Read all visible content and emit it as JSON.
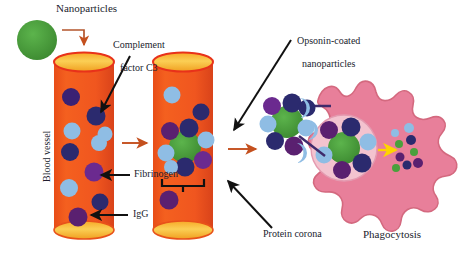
{
  "figure": {
    "type": "biomedical-schematic",
    "title_visible": false,
    "background": "#ffffff"
  },
  "labels": {
    "nanoparticles": "Nanoparticles",
    "complement_line1": "Complement",
    "complement_line2": "factor C3",
    "blood_vessel": "Blood vessel",
    "fibrinogen": "Fibrinogen",
    "igg": "IgG",
    "opsonin_line1": "Opsonin-coated",
    "opsonin_line2": "nanoparticles",
    "protein_corona": "Protein corona",
    "phagocytosis": "Phagocytosis"
  },
  "colors": {
    "nanoparticle_green": "#4aa03c",
    "nanoparticle_green_dark": "#3d8a31",
    "vessel_orange": "#f0561f",
    "vessel_edge": "#d9431a",
    "vessel_lumen_yellow": "#f9c23c",
    "vessel_lumen_edge": "#e8321a",
    "protein_navy": "#2b2a6e",
    "protein_purple": "#5a2070",
    "protein_violet": "#6b2a8f",
    "protein_lightblue": "#8fbde4",
    "cell_pink": "#e87f9a",
    "cell_pink_edge": "#d46a86",
    "phagosome_fill": "#f3c3cf",
    "arrow_orange": "#c4501e",
    "arrow_black": "#000000",
    "arrow_yellow": "#ffd400",
    "receptor_purple": "#3f2a6b"
  },
  "elements": {
    "free_nanoparticle": {
      "name": "free-nanoparticle",
      "cx": 37,
      "cy": 40,
      "r": 20
    },
    "vessel_left": {
      "name": "blood-vessel-left",
      "x": 54,
      "y": 50,
      "w": 60,
      "h": 190
    },
    "vessel_right": {
      "name": "blood-vessel-right",
      "x": 153,
      "y": 50,
      "w": 60,
      "h": 190
    },
    "corona_cluster": {
      "name": "protein-corona-cluster",
      "cx": 185,
      "cy": 147
    },
    "opsonin_cluster": {
      "name": "opsonin-coated-nanoparticle",
      "cx": 287,
      "cy": 122
    },
    "macrophage": {
      "name": "macrophage-cell",
      "cx": 375,
      "cy": 150
    },
    "phagosome": {
      "name": "phagosome",
      "cx": 344,
      "cy": 148,
      "r": 33
    },
    "degradation_products": {
      "name": "degradation-products",
      "cx": 400,
      "cy": 150
    }
  },
  "particle_counts": {
    "vessel_left_navy": 4,
    "vessel_left_lightblue": 4,
    "vessel_left_purple": 3,
    "vessel_right_free": 5,
    "corona_ring": 7,
    "phagosome_ring": 6
  }
}
